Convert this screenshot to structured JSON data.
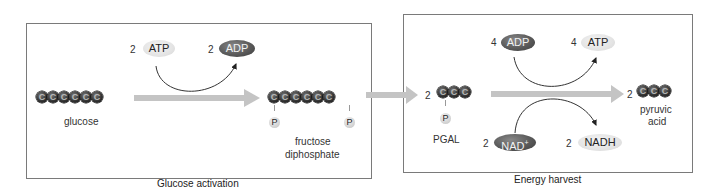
{
  "panels": {
    "glucose_activation": {
      "caption": "Glucose activation",
      "input_molecule": {
        "label": "glucose",
        "carbons": [
          "C",
          "C",
          "C",
          "C",
          "C",
          "C"
        ]
      },
      "output_molecule": {
        "label_line1": "fructose",
        "label_line2": "diphosphate",
        "carbons": [
          "C",
          "C",
          "C",
          "C",
          "C",
          "C"
        ],
        "phosphates": [
          "P",
          "P"
        ]
      },
      "energy_in": {
        "count": "2",
        "name": "ATP"
      },
      "energy_out": {
        "count": "2",
        "name": "ADP"
      }
    },
    "energy_harvest": {
      "caption": "Energy harvest",
      "input_molecule": {
        "count": "2",
        "label": "PGAL",
        "carbons": [
          "C",
          "C",
          "C"
        ],
        "phosphate": "P"
      },
      "output_molecule": {
        "count": "2",
        "label_line1": "pyruvic",
        "label_line2": "acid",
        "carbons": [
          "C",
          "C",
          "C"
        ]
      },
      "adp_in": {
        "count": "4",
        "name": "ADP"
      },
      "atp_out": {
        "count": "4",
        "name": "ATP"
      },
      "nad_in": {
        "count": "2",
        "name": "NAD",
        "superscript": "+"
      },
      "nadh_out": {
        "count": "2",
        "name": "NADH"
      }
    }
  },
  "colors": {
    "border": "#7a7a7a",
    "main_arrow": "#c4c4c4",
    "carbon_dark": "#222222",
    "light_pill": "#e4e4e4",
    "dark_pill": "#555555",
    "curve": "#333333"
  }
}
